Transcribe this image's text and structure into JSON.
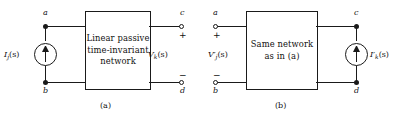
{
  "figure": {
    "type": "circuit-diagram",
    "caption_a": "(a)",
    "caption_b": "(b)",
    "line_color": "#1a1a1a",
    "background": "#ffffff"
  },
  "panel_a": {
    "box_text_line1": "Linear passive",
    "box_text_line2": "time-invariant",
    "box_text_line3": "network",
    "source": {
      "kind": "current-source",
      "symbol": "circle-with-up-arrow",
      "label_main": "I",
      "label_sub": "j",
      "label_arg": "(s)",
      "label_full": "I j (s)"
    },
    "output": {
      "kind": "voltage-label",
      "label_main": "V",
      "label_sub": "k",
      "label_arg": "(s)",
      "label_full": "V k (s)",
      "plus": "+",
      "minus": "−"
    },
    "terminals": {
      "top_left": "a",
      "bottom_left": "b",
      "top_right": "c",
      "bottom_right": "d"
    }
  },
  "panel_b": {
    "box_text_line1": "Same network",
    "box_text_line2": "as in (a)",
    "source": {
      "kind": "voltage-label",
      "label_main": "V",
      "label_prime": "′",
      "label_sub": "j",
      "label_arg": "(s)",
      "label_full": "V′ j (s)",
      "plus": "+",
      "minus": "−"
    },
    "output": {
      "kind": "current-source",
      "symbol": "circle-with-up-arrow",
      "label_main": "I",
      "label_prime": "′",
      "label_sub": "k",
      "label_arg": "(s)",
      "label_full": "I′ k (s)"
    },
    "terminals": {
      "top_left": "a",
      "bottom_left": "b",
      "top_right": "c",
      "bottom_right": "d"
    }
  }
}
